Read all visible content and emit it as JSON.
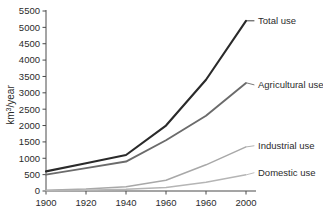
{
  "chart_data": {
    "type": "line",
    "title": "",
    "xlabel": "",
    "ylabel": "km3/year",
    "ylabel_parts": {
      "base": "km",
      "exponent": "3",
      "suffix": "/year"
    },
    "x": [
      1900,
      1920,
      1940,
      1960,
      1980,
      2000
    ],
    "xtick_labels": [
      "1900",
      "1920",
      "1940",
      "1960",
      "1960",
      "2000"
    ],
    "ytick_labels": [
      "0",
      "500",
      "1000",
      "1500",
      "2000",
      "2500",
      "3000",
      "3500",
      "4000",
      "4500",
      "5000",
      "5500"
    ],
    "ytick_values": [
      0,
      500,
      1000,
      1500,
      2000,
      2500,
      3000,
      3500,
      4000,
      4500,
      5000,
      5500
    ],
    "xlim": [
      1900,
      2000
    ],
    "ylim": [
      0,
      5500
    ],
    "grid": false,
    "legend_position": "right-inline-labels",
    "series": [
      {
        "name": "Total use",
        "label": "Total use",
        "color": "#2a2a2a",
        "width": 2.1,
        "values": [
          600,
          850,
          1100,
          2000,
          3400,
          5200
        ]
      },
      {
        "name": "Agricultural use",
        "label": "Agricultural use",
        "color": "#6b6b6b",
        "width": 1.9,
        "values": [
          500,
          700,
          900,
          1550,
          2300,
          3300
        ]
      },
      {
        "name": "Industrial use",
        "label": "Industrial use",
        "color": "#a8a8a8",
        "width": 1.5,
        "values": [
          20,
          60,
          130,
          330,
          800,
          1350
        ]
      },
      {
        "name": "Domestic use",
        "label": "Domestic use",
        "color": "#b5b5b5",
        "width": 1.5,
        "values": [
          10,
          25,
          50,
          110,
          270,
          500
        ]
      }
    ]
  }
}
